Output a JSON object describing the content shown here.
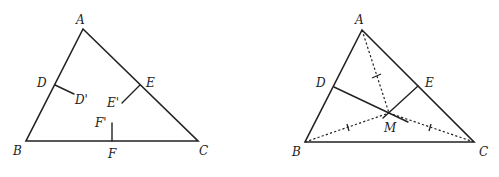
{
  "figure_left": {
    "description": "Triangle ABC with perpendicular bisector stubs from midpoints D, E, F",
    "vertices": {
      "A": "A",
      "B": "B",
      "C": "C"
    },
    "midpoints": {
      "D": "D",
      "E": "E",
      "F": "F"
    },
    "bisector_ends": {
      "D_prime": "D'",
      "E_prime": "E'",
      "F_prime": "F'"
    }
  },
  "figure_right": {
    "description": "Triangle ABC with perpendicular bisectors from D and E meeting at M; dashed segments MA, MB, MC marked congruent",
    "vertices": {
      "A": "A",
      "B": "B",
      "C": "C"
    },
    "midpoints": {
      "D": "D",
      "E": "E"
    },
    "intersection": {
      "M": "M"
    }
  },
  "colors": {
    "stroke": "#222222",
    "background": "#ffffff"
  }
}
